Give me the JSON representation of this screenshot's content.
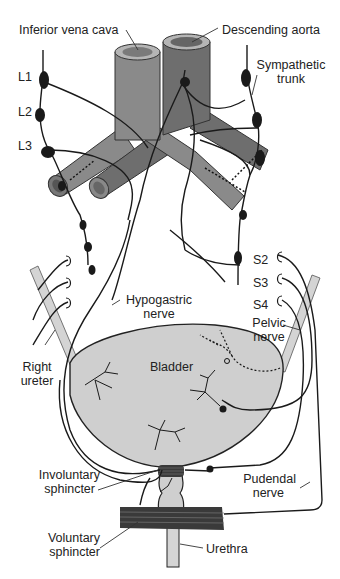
{
  "diagram": {
    "type": "anatomical-illustration",
    "colors": {
      "vessel_ivc": "#8a8a8a",
      "vessel_aorta": "#6e6e6e",
      "vessel_rim": "#b5b5b5",
      "bladder_fill": "#cfcfcf",
      "ureter_fill": "#d4d4d4",
      "nerve": "#1a1a1a",
      "ganglion": "#1a1a1a",
      "sphincter": "#3a3a3a"
    },
    "labels": {
      "ivc": "Inferior vena cava",
      "aorta": "Descending aorta",
      "sympathetic_1": "Sympathetic",
      "sympathetic_2": "trunk",
      "l1": "L1",
      "l2": "L2",
      "l3": "L3",
      "s2": "S2",
      "s3": "S3",
      "s4": "S4",
      "hypogastric_1": "Hypogastric",
      "hypogastric_2": "nerve",
      "pelvic_1": "Pelvic",
      "pelvic_2": "nerve",
      "right_ureter_1": "Right",
      "right_ureter_2": "ureter",
      "bladder": "Bladder",
      "involuntary_1": "Involuntary",
      "involuntary_2": "sphincter",
      "pudendal_1": "Pudendal",
      "pudendal_2": "nerve",
      "voluntary_1": "Voluntary",
      "voluntary_2": "sphincter",
      "urethra": "Urethra"
    }
  }
}
